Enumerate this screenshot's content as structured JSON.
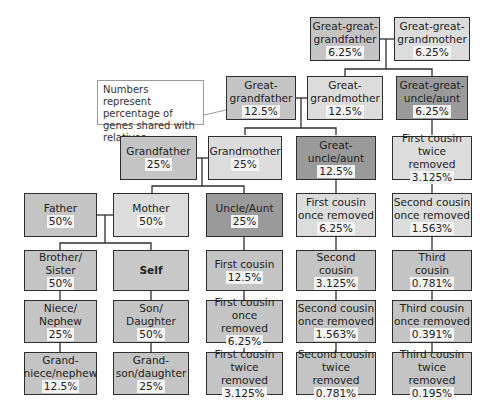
{
  "note": "Numbers represent percentage of genes shared with relatives.",
  "nodes": {
    "gg_grandfather": {
      "label": "Great-great-\ngrandfather",
      "percent": "6.25%"
    },
    "gg_grandmother": {
      "label": "Great-great-\ngrandmother",
      "percent": "6.25%"
    },
    "g_grandfather": {
      "label": "Great-\ngrandfather",
      "percent": "12.5%"
    },
    "g_grandmother": {
      "label": "Great-\ngrandmother",
      "percent": "12.5%"
    },
    "gg_uncle_aunt": {
      "label": "Great-great-\nuncle/aunt",
      "percent": "6.25%"
    },
    "grandfather": {
      "label": "Grandfather",
      "percent": "25%"
    },
    "grandmother": {
      "label": "Grandmother",
      "percent": "25%"
    },
    "g_uncle_aunt": {
      "label": "Great-\nuncle/aunt",
      "percent": "12.5%"
    },
    "fc_twice_removed_up": {
      "label": "First cousin\ntwice removed",
      "percent": "3.125%"
    },
    "father": {
      "label": "Father",
      "percent": "50%"
    },
    "mother": {
      "label": "Mother",
      "percent": "50%"
    },
    "uncle_aunt": {
      "label": "Uncle/Aunt",
      "percent": "25%"
    },
    "fc_once_removed_up": {
      "label": "First cousin\nonce removed",
      "percent": "6.25%"
    },
    "sc_once_removed_up": {
      "label": "Second cousin\nonce removed",
      "percent": "1.563%"
    },
    "brother_sister": {
      "label": "Brother/\nSister",
      "percent": "50%"
    },
    "self": {
      "label": "Self",
      "percent": ""
    },
    "first_cousin": {
      "label": "First cousin",
      "percent": "12.5%"
    },
    "second_cousin": {
      "label": "Second\ncousin",
      "percent": "3.125%"
    },
    "third_cousin": {
      "label": "Third\ncousin",
      "percent": "0.781%"
    },
    "niece_nephew": {
      "label": "Niece/\nNephew",
      "percent": "25%"
    },
    "son_daughter": {
      "label": "Son/\nDaughter",
      "percent": "50%"
    },
    "fc_once_removed": {
      "label": "First cousin\nonce removed",
      "percent": "6.25%"
    },
    "sc_once_removed": {
      "label": "Second cousin\nonce removed",
      "percent": "1.563%"
    },
    "tc_once_removed": {
      "label": "Third cousin\nonce removed",
      "percent": "0.391%"
    },
    "grandniece_nephew": {
      "label": "Grand-\nniece/nephew",
      "percent": "12.5%"
    },
    "grandson_daughter": {
      "label": "Grand-\nson/daughter",
      "percent": "25%"
    },
    "fc_twice_removed": {
      "label": "First cousin\ntwice removed",
      "percent": "3.125%"
    },
    "sc_twice_removed": {
      "label": "Second cousin\ntwice removed",
      "percent": "0.781%"
    },
    "tc_twice_removed": {
      "label": "Third cousin\ntwice removed",
      "percent": "0.195%"
    }
  },
  "colors": {
    "light": "#dcdcdc",
    "medium": "#c4c4c4",
    "dark": "#9a9a9a",
    "border": "#2e2e2e"
  }
}
